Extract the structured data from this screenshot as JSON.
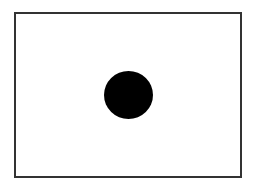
{
  "diagram": {
    "frame": {
      "shape": "rectangle",
      "border_color": "#333333",
      "fill": "#ffffff"
    },
    "dot": {
      "shape": "circle",
      "fill": "#000000",
      "position": "center"
    }
  }
}
